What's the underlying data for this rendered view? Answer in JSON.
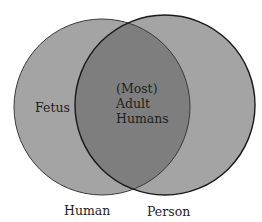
{
  "diagram": {
    "type": "venn",
    "sets": [
      {
        "name": "Human",
        "label": "Human"
      },
      {
        "name": "Person",
        "label": "Person"
      }
    ],
    "regions": {
      "human_only": "Fetus",
      "intersection": [
        "(Most)",
        "Adult",
        "Humans"
      ]
    },
    "colors": {
      "single_fill": "#a4a4a4",
      "overlap_fill": "#7e7e7e",
      "stroke": "#1a1a1a",
      "text": "#1e1e1e"
    }
  }
}
